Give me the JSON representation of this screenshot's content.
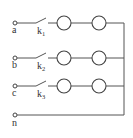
{
  "diagram": {
    "type": "three-phase circuit",
    "phases": [
      {
        "terminal": "a",
        "switch": "k",
        "switch_sub": "1",
        "lamps": 2
      },
      {
        "terminal": "b",
        "switch": "k",
        "switch_sub": "2",
        "lamps": 2
      },
      {
        "terminal": "c",
        "switch": "k",
        "switch_sub": "3",
        "lamps": 2
      }
    ],
    "neutral": {
      "terminal": "n"
    },
    "colors": {
      "line": "#555555",
      "background": "#ffffff"
    }
  }
}
